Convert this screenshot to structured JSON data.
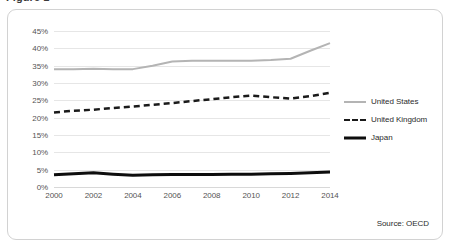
{
  "figure": {
    "clipped_title": "Figure 1",
    "source_note": "Source: OECD",
    "frame_color": "#d2d2d2",
    "grid_color": "#e6e6e6"
  },
  "legend": {
    "position": "right",
    "items": [
      {
        "label": "United States",
        "style": "solid",
        "color": "#b4b4b4",
        "swatch": "sw-solid-gray"
      },
      {
        "label": "United Kingdom",
        "style": "dashed",
        "color": "#1a1a1a",
        "swatch": "sw-dashed"
      },
      {
        "label": "Japan",
        "style": "solid-thick",
        "color": "#0d0d0d",
        "swatch": "sw-solid-black"
      }
    ]
  },
  "chart_data": {
    "type": "line",
    "title": "",
    "xlabel": "",
    "ylabel": "",
    "grid": true,
    "legend_position": "right",
    "x": [
      2000,
      2001,
      2002,
      2003,
      2004,
      2005,
      2006,
      2007,
      2008,
      2009,
      2010,
      2011,
      2012,
      2013,
      2014
    ],
    "xlim": [
      2000,
      2014
    ],
    "xticks": [
      2000,
      2002,
      2004,
      2006,
      2008,
      2010,
      2012,
      2014
    ],
    "xtick_labels": [
      "2000",
      "2002",
      "2004",
      "2006",
      "2008",
      "2010",
      "2012",
      "2014"
    ],
    "ylim": [
      0,
      45
    ],
    "yticks": [
      0,
      5,
      10,
      15,
      20,
      25,
      30,
      35,
      40,
      45
    ],
    "ytick_labels": [
      "0%",
      "5%",
      "10%",
      "15%",
      "20%",
      "25%",
      "30%",
      "35%",
      "40%",
      "45%"
    ],
    "y_unit": "%",
    "series": [
      {
        "name": "United States",
        "color": "#b4b4b4",
        "style": "solid",
        "width": 2,
        "values": [
          34.0,
          34.0,
          34.1,
          34.0,
          34.0,
          35.0,
          36.2,
          36.4,
          36.4,
          36.4,
          36.4,
          36.6,
          37.0,
          39.3,
          41.5
        ]
      },
      {
        "name": "United Kingdom",
        "color": "#1a1a1a",
        "style": "dashed",
        "width": 2.5,
        "values": [
          21.5,
          22.0,
          22.3,
          22.8,
          23.2,
          23.7,
          24.2,
          24.8,
          25.3,
          25.9,
          26.4,
          25.9,
          25.5,
          26.2,
          27.2
        ]
      },
      {
        "name": "Japan",
        "color": "#0d0d0d",
        "style": "solid-thick",
        "width": 3,
        "values": [
          3.5,
          3.8,
          4.1,
          3.7,
          3.4,
          3.5,
          3.6,
          3.6,
          3.6,
          3.7,
          3.7,
          3.8,
          3.9,
          4.1,
          4.3
        ]
      }
    ]
  }
}
